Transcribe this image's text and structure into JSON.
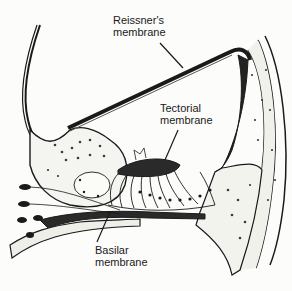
{
  "diagram": {
    "labels": [
      {
        "id": "reissner",
        "line1": "Reissner's",
        "line2": "membrane"
      },
      {
        "id": "tectorial",
        "line1": "Tectorial",
        "line2": "membrane"
      },
      {
        "id": "basilar",
        "line1": "Basilar",
        "line2": "membrane"
      }
    ]
  },
  "colors": {
    "ink": "#1a1a1a",
    "paper": "#fcfcfa",
    "stipple": "#3a3a3a"
  }
}
